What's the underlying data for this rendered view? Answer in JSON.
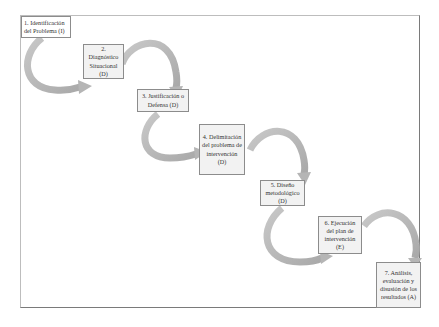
{
  "diagram": {
    "steps": [
      {
        "label": "1. Identificación del Problema (I)"
      },
      {
        "label": "2. Diagnóstico Situacional (D)"
      },
      {
        "label": "3. Justificación o Defensa (D)"
      },
      {
        "label": "4. Delimitación del problema de intervención (D)"
      },
      {
        "label": "5. Diseño metodológico (D)"
      },
      {
        "label": "6. Ejecución del plan de intervención (E)"
      },
      {
        "label": "7. Análisis, evaluación y disusión de los resultados (A)"
      }
    ],
    "colors": {
      "arrow": "#bdbdbd",
      "box_fill": "#f2f2f2",
      "box_border": "#8c8c8c",
      "frame": "#9e9e9e"
    }
  }
}
